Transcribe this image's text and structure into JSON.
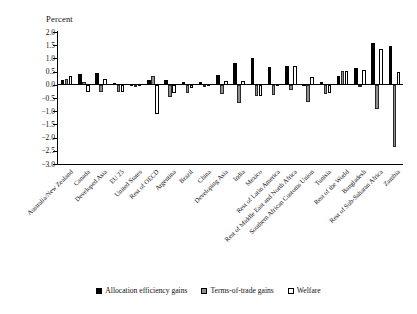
{
  "chart_data": {
    "type": "bar",
    "title": "",
    "xlabel": "",
    "ylabel": "Percent",
    "ylim": [
      -3.0,
      2.0
    ],
    "ytick_labels": [
      "2.0",
      "1.5",
      "1.0",
      "0.5",
      "0.0",
      "-0.5",
      "-1.0",
      "-1.5",
      "-2.0",
      "-2.5",
      "-3.0"
    ],
    "ytick_values": [
      2.0,
      1.5,
      1.0,
      0.5,
      0.0,
      -0.5,
      -1.0,
      -1.5,
      -2.0,
      -2.5,
      -3.0
    ],
    "grid": false,
    "legend_position": "bottom",
    "categories": [
      "Australia/New Zealand",
      "Canada",
      "Developed Asia",
      "EU 25",
      "United States",
      "Rest of OECD",
      "Argentina",
      "Brazil",
      "China",
      "Developing Asia",
      "India",
      "Mexico",
      "Rest of Latin America",
      "Rest of Middle East and North Africa",
      "Southern African Customs Union",
      "Tunisia",
      "Rest of the World",
      "Bangladesh",
      "Rest of Sub-Saharan Africa",
      "Zambia"
    ],
    "series": [
      {
        "name": "Allocation efficiency gains",
        "color": "#000000",
        "values": [
          0.18,
          0.4,
          0.43,
          0.08,
          0.03,
          0.18,
          0.17,
          0.12,
          0.12,
          0.36,
          0.82,
          1.0,
          0.67,
          0.73,
          0.02,
          0.11,
          0.35,
          0.63,
          1.58,
          1.48
        ]
      },
      {
        "name": "Terms-of-trade gains",
        "color": "#8f8f8f",
        "values": [
          0.23,
          0.11,
          -0.26,
          -0.26,
          0.0,
          0.35,
          -0.48,
          -0.32,
          -0.1,
          -0.35,
          -0.7,
          -0.43,
          -0.37,
          -0.2,
          -0.66,
          -0.33,
          0.51,
          -0.09,
          -0.9,
          -2.34
        ]
      },
      {
        "name": "Welfare",
        "color": "#ffffff",
        "values": [
          0.33,
          -0.26,
          0.22,
          -0.26,
          0.03,
          -1.11,
          -0.3,
          -0.12,
          0.04,
          0.13,
          0.16,
          -0.44,
          0.02,
          0.7,
          0.3,
          -0.31,
          0.51,
          0.57,
          1.35,
          0.5
        ]
      }
    ]
  },
  "legend": {
    "items": [
      {
        "label": "Allocation efficiency gains",
        "swatch": "alloc"
      },
      {
        "label": "Terms-of-trade gains",
        "swatch": "tot"
      },
      {
        "label": "Welfare",
        "swatch": "wel"
      }
    ]
  }
}
